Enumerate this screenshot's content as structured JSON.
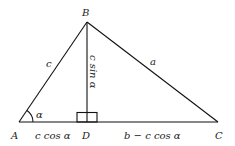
{
  "diagram": {
    "type": "triangle-altitude",
    "vertices": {
      "A": {
        "label": "A",
        "x": 19,
        "y": 122
      },
      "B": {
        "label": "B",
        "x": 87,
        "y": 22
      },
      "C": {
        "label": "C",
        "x": 218,
        "y": 122
      },
      "D": {
        "label": "D",
        "x": 87,
        "y": 122
      }
    },
    "side_labels": {
      "c": "c",
      "a": "a",
      "altitude": "c sin α",
      "AD": "c cos α",
      "DC": "b − c cos α"
    },
    "angle_label": "α",
    "colors": {
      "line": "#111111",
      "text": "#222222",
      "background": "#ffffff"
    }
  }
}
